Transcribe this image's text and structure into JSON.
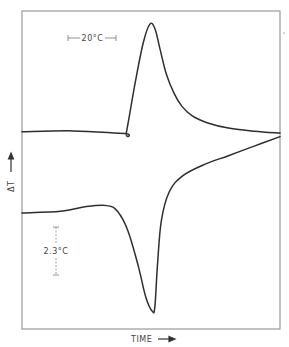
{
  "chart_data": {
    "type": "line",
    "title": "",
    "xlabel": "TIME",
    "ylabel": "ΔT",
    "xlim": [
      0,
      100
    ],
    "ylim": [
      0,
      100
    ],
    "grid": false,
    "legend": "none",
    "x_ticks": [],
    "y_ticks": [],
    "annotations": [
      {
        "text": "20°C",
        "kind": "horizontal-scale-bar",
        "placement": "top-left"
      },
      {
        "text": "2.3°C",
        "kind": "vertical-scale-bar",
        "placement": "lower-left"
      }
    ],
    "series": [
      {
        "name": "upper-curve (exotherm)",
        "x": [
          0,
          20,
          40,
          40.5,
          44,
          47,
          49.5,
          51.5,
          53.5,
          56,
          59,
          62,
          66,
          72,
          80,
          90,
          100
        ],
        "y": [
          62,
          62.3,
          61.5,
          62,
          78,
          90,
          95.8,
          94.5,
          88,
          80,
          74,
          70,
          67,
          64.8,
          63.2,
          62.2,
          61.6
        ]
      },
      {
        "name": "lower-curve (endotherm)",
        "x": [
          0,
          15,
          25,
          33,
          37,
          41,
          45,
          48,
          50.5,
          51.5,
          52.5,
          54,
          57,
          62,
          70,
          80,
          90,
          100
        ],
        "y": [
          36.5,
          37,
          38.5,
          38.8,
          37,
          31,
          20,
          10,
          5.6,
          7,
          20,
          34,
          43,
          48,
          51.5,
          54.5,
          57.5,
          60.5
        ]
      }
    ]
  },
  "labels": {
    "x_axis": "TIME",
    "y_axis": "ΔT",
    "scale_h": "20°C",
    "scale_v": "2.3°C"
  }
}
